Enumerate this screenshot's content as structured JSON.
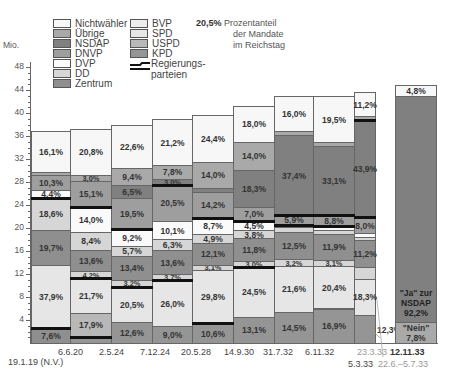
{
  "chart_data": {
    "type": "bar",
    "subtype": "stacked-variable-width (Mekko) bar chart",
    "title": "",
    "ylabel": "Mio.",
    "ylim": [
      0,
      48
    ],
    "yticks": [
      4,
      8,
      12,
      16,
      20,
      24,
      28,
      32,
      36,
      40,
      44,
      48
    ],
    "note": {
      "value": "20,5%",
      "text": "Prozentanteil der Mandate im Reichstag"
    },
    "legend": [
      {
        "name": "Nichtwähler",
        "color": "#f7f7f7"
      },
      {
        "name": "Übrige",
        "color": "#a9a9a9"
      },
      {
        "name": "NSDAP",
        "color": "#808080"
      },
      {
        "name": "DNVP",
        "color": "#9e9e9e"
      },
      {
        "name": "DVP",
        "color": "#fafafa"
      },
      {
        "name": "DD",
        "color": "#d6d6d6"
      },
      {
        "name": "Zentrum",
        "color": "#8f8f8f"
      },
      {
        "name": "BVP",
        "color": "#ececec"
      },
      {
        "name": "SPD",
        "color": "#e6e6e6"
      },
      {
        "name": "USPD",
        "color": "#b8b8b8"
      },
      {
        "name": "KPD",
        "color": "#959595"
      },
      {
        "name": "Regierungsparteien",
        "color": "#111111",
        "type": "line"
      }
    ],
    "categories": [
      "19.1.19 (N.V.)",
      "6.6.20",
      "2.5.24",
      "7.12.24",
      "20.5.28",
      "14.9.30",
      "31.7.32",
      "6.11.32",
      "5.3.33",
      "12.11.33"
    ],
    "extra_labels": [
      "23.3.33",
      "22.6.–5.7.33"
    ],
    "columns": [
      {
        "date": "19.1.19 (N.V.)",
        "segments": [
          {
            "party": "Zentrum",
            "label": "7,6%",
            "from": 0,
            "to": 2.6
          },
          {
            "party": "SPD",
            "label": "37,9%",
            "from": 2.6,
            "to": 13.6
          },
          {
            "party": "Zentrum",
            "label": "19,7%",
            "from": 13.6,
            "to": 19.7
          },
          {
            "party": "DD",
            "label": "18,6%",
            "from": 19.7,
            "to": 25.3
          },
          {
            "party": "DVP",
            "label": "4,4%",
            "from": 25.3,
            "to": 26.6
          },
          {
            "party": "DNVP",
            "label": "10,3%",
            "from": 26.6,
            "to": 29.2
          },
          {
            "party": "Übrige",
            "label": "",
            "from": 29.2,
            "to": 29.8
          },
          {
            "party": "Nichtwähler",
            "label": "16,1%",
            "from": 29.8,
            "to": 36.8
          }
        ]
      },
      {
        "date": "6.6.20",
        "segments": [
          {
            "party": "KPD",
            "label": "",
            "from": 0,
            "to": 1
          },
          {
            "party": "USPD",
            "label": "17,9%",
            "from": 1,
            "to": 5.3
          },
          {
            "party": "SPD",
            "label": "21,7%",
            "from": 5.3,
            "to": 11.3
          },
          {
            "party": "DD",
            "label": "4,2%",
            "from": 11.3,
            "to": 12.5
          },
          {
            "party": "Zentrum",
            "label": "13,6%",
            "from": 12.5,
            "to": 16.2
          },
          {
            "party": "DD",
            "label": "8,4%",
            "from": 16.2,
            "to": 19.3
          },
          {
            "party": "DVP",
            "label": "14,0%",
            "from": 19.3,
            "to": 23.7
          },
          {
            "party": "DNVP",
            "label": "15,1%",
            "from": 23.7,
            "to": 28.2
          },
          {
            "party": "Übrige",
            "label": "3,0%",
            "from": 28.2,
            "to": 29.3
          },
          {
            "party": "Nichtwähler",
            "label": "20,8%",
            "from": 29.3,
            "to": 37.2
          }
        ]
      },
      {
        "date": "2.5.24",
        "segments": [
          {
            "party": "KPD",
            "label": "12,6%",
            "from": 0,
            "to": 3.7
          },
          {
            "party": "SPD",
            "label": "20,5%",
            "from": 3.7,
            "to": 9.8
          },
          {
            "party": "DD",
            "label": "3,2%",
            "from": 9.8,
            "to": 10.9
          },
          {
            "party": "Zentrum",
            "label": "13,4%",
            "from": 10.9,
            "to": 15.2
          },
          {
            "party": "DD",
            "label": "5,7%",
            "from": 15.2,
            "to": 16.9
          },
          {
            "party": "DVP",
            "label": "9,2%",
            "from": 16.9,
            "to": 19.9
          },
          {
            "party": "DNVP",
            "label": "19,5%",
            "from": 19.9,
            "to": 25.3
          },
          {
            "party": "NSDAP",
            "label": "6,5%",
            "from": 25.3,
            "to": 27.5
          },
          {
            "party": "Übrige",
            "label": "9,4%",
            "from": 27.5,
            "to": 30.4
          },
          {
            "party": "Nichtwähler",
            "label": "22,6%",
            "from": 30.4,
            "to": 38.0
          }
        ]
      },
      {
        "date": "7.12.24",
        "segments": [
          {
            "party": "KPD",
            "label": "9,0%",
            "from": 0,
            "to": 2.9
          },
          {
            "party": "SPD",
            "label": "26,0%",
            "from": 2.9,
            "to": 11.0
          },
          {
            "party": "DD",
            "label": "3,7%",
            "from": 11.0,
            "to": 12.0
          },
          {
            "party": "Zentrum",
            "label": "13,6%",
            "from": 12.0,
            "to": 16.1
          },
          {
            "party": "DD",
            "label": "6,3%",
            "from": 16.1,
            "to": 18.1
          },
          {
            "party": "DVP",
            "label": "10,1%",
            "from": 18.1,
            "to": 21.2
          },
          {
            "party": "DNVP",
            "label": "20,5%",
            "from": 21.2,
            "to": 27.5
          },
          {
            "party": "NSDAP",
            "label": "3,0%",
            "from": 27.5,
            "to": 28.5
          },
          {
            "party": "Übrige",
            "label": "7,8%",
            "from": 28.5,
            "to": 31.0
          },
          {
            "party": "Nichtwähler",
            "label": "21,2%",
            "from": 31.0,
            "to": 38.9
          }
        ]
      },
      {
        "date": "20.5.28",
        "segments": [
          {
            "party": "KPD",
            "label": "10,6%",
            "from": 0,
            "to": 3.4
          },
          {
            "party": "SPD",
            "label": "29,8%",
            "from": 3.4,
            "to": 12.7
          },
          {
            "party": "DD",
            "label": "3,1%",
            "from": 12.7,
            "to": 13.6
          },
          {
            "party": "Zentrum",
            "label": "12,1%",
            "from": 13.6,
            "to": 17.4
          },
          {
            "party": "DD",
            "label": "4,9%",
            "from": 17.4,
            "to": 19.0
          },
          {
            "party": "DVP",
            "label": "8,7%",
            "from": 19.0,
            "to": 21.8
          },
          {
            "party": "DNVP",
            "label": "14,2%",
            "from": 21.8,
            "to": 26.3
          },
          {
            "party": "NSDAP",
            "label": "",
            "from": 26.3,
            "to": 27.0
          },
          {
            "party": "Übrige",
            "label": "14,0%",
            "from": 27.0,
            "to": 31.5
          },
          {
            "party": "Nichtwähler",
            "label": "24,4%",
            "from": 31.5,
            "to": 39.6
          }
        ]
      },
      {
        "date": "14.9.30",
        "segments": [
          {
            "party": "KPD",
            "label": "13,1%",
            "from": 0,
            "to": 4.6
          },
          {
            "party": "SPD",
            "label": "24,5%",
            "from": 4.6,
            "to": 13.2
          },
          {
            "party": "DD",
            "label": "3,0%",
            "from": 13.2,
            "to": 14.2
          },
          {
            "party": "Zentrum",
            "label": "11,8%",
            "from": 14.2,
            "to": 18.3
          },
          {
            "party": "DD",
            "label": "3,8%",
            "from": 18.3,
            "to": 19.6
          },
          {
            "party": "DVP",
            "label": "4,5%",
            "from": 19.6,
            "to": 21.2
          },
          {
            "party": "DNVP",
            "label": "7,0%",
            "from": 21.2,
            "to": 23.7
          },
          {
            "party": "NSDAP",
            "label": "18,3%",
            "from": 23.7,
            "to": 30.1
          },
          {
            "party": "Übrige",
            "label": "14,0%",
            "from": 30.1,
            "to": 35.0
          },
          {
            "party": "Nichtwähler",
            "label": "18,0%",
            "from": 35.0,
            "to": 41.3
          }
        ]
      },
      {
        "date": "31.7.32",
        "segments": [
          {
            "party": "KPD",
            "label": "14,5%",
            "from": 0,
            "to": 5.4
          },
          {
            "party": "SPD",
            "label": "21,6%",
            "from": 5.4,
            "to": 13.4
          },
          {
            "party": "DD",
            "label": "3,2%",
            "from": 13.4,
            "to": 14.6
          },
          {
            "party": "Zentrum",
            "label": "12,5%",
            "from": 14.6,
            "to": 19.3
          },
          {
            "party": "DD",
            "label": "",
            "from": 19.3,
            "to": 20.1
          },
          {
            "party": "DVP",
            "label": "",
            "from": 20.1,
            "to": 20.6
          },
          {
            "party": "DNVP",
            "label": "5,9%",
            "from": 20.6,
            "to": 22.2
          },
          {
            "party": "NSDAP",
            "label": "37,4%",
            "from": 22.2,
            "to": 36.2
          },
          {
            "party": "Übrige",
            "label": "",
            "from": 36.2,
            "to": 36.9
          },
          {
            "party": "Nichtwähler",
            "label": "16,0%",
            "from": 36.9,
            "to": 42.9
          }
        ]
      },
      {
        "date": "6.11.32",
        "segments": [
          {
            "party": "KPD",
            "label": "16,9%",
            "from": 0,
            "to": 6.0
          },
          {
            "party": "SPD",
            "label": "20,4%",
            "from": 6.0,
            "to": 13.4
          },
          {
            "party": "DD",
            "label": "3,1%",
            "from": 13.4,
            "to": 14.5
          },
          {
            "party": "Zentrum",
            "label": "11,9%",
            "from": 14.5,
            "to": 18.9
          },
          {
            "party": "DD",
            "label": "",
            "from": 18.9,
            "to": 19.6
          },
          {
            "party": "DVP",
            "label": "",
            "from": 19.6,
            "to": 20.3
          },
          {
            "party": "DNVP",
            "label": "8,8%",
            "from": 20.3,
            "to": 22.2
          },
          {
            "party": "NSDAP",
            "label": "33,1%",
            "from": 22.2,
            "to": 34.3
          },
          {
            "party": "Übrige",
            "label": "",
            "from": 34.3,
            "to": 35.0
          },
          {
            "party": "Nichtwähler",
            "label": "19,5%",
            "from": 35.0,
            "to": 42.9
          }
        ]
      },
      {
        "date": "5.3.33",
        "segments": [
          {
            "party": "KPD",
            "label": "12,3%",
            "from": 0,
            "to": 4.8
          },
          {
            "party": "SPD",
            "label": "18,3%",
            "from": 4.8,
            "to": 11.2
          },
          {
            "party": "DD",
            "label": "",
            "from": 11.2,
            "to": 13.2
          },
          {
            "party": "Zentrum",
            "label": "11,2%",
            "from": 13.2,
            "to": 17.9
          },
          {
            "party": "DD",
            "label": "",
            "from": 17.9,
            "to": 18.5
          },
          {
            "party": "DVP",
            "label": "",
            "from": 18.5,
            "to": 19.1
          },
          {
            "party": "DNVP",
            "label": "8,0%",
            "from": 19.1,
            "to": 21.9
          },
          {
            "party": "NSDAP",
            "label": "43,9%",
            "from": 21.9,
            "to": 38.8
          },
          {
            "party": "Übrige",
            "label": "",
            "from": 38.8,
            "to": 39.4
          },
          {
            "party": "Nichtwähler",
            "label": "11,2%",
            "from": 39.4,
            "to": 43.7
          }
        ]
      },
      {
        "date": "12.11.33",
        "segments": [
          {
            "party": "Übrige",
            "label": "\"Nein\" 7,8%",
            "from": 0,
            "to": 3.6
          },
          {
            "party": "NSDAP",
            "label": "\"Ja\" zur NSDAP 92,2%",
            "from": 3.6,
            "to": 43.0
          },
          {
            "party": "Nichtwähler",
            "label": "4,8%",
            "from": 43.0,
            "to": 44.9
          }
        ]
      }
    ]
  },
  "legend": {
    "col1": [
      "Nichtwähler",
      "Übrige",
      "NSDAP",
      "DNVP",
      "DVP",
      "DD",
      "Zentrum"
    ],
    "col2": [
      "BVP",
      "SPD",
      "USPD",
      "KPD"
    ],
    "gov_line_1": "Regierungs-",
    "gov_line_2": "parteien"
  },
  "note": {
    "value": "20,5%",
    "line1": "Prozentanteil",
    "line2": "der Mandate",
    "line3": "im Reichstag"
  },
  "axis": {
    "unit": "Mio.",
    "ticks": [
      "48",
      "44",
      "40",
      "36",
      "32",
      "28",
      "24",
      "20",
      "16",
      "12",
      "8",
      "4"
    ]
  },
  "xlabels": {
    "d1": "19.1.19 (N.V.)",
    "d2": "6.6.20",
    "d3": "2.5.24",
    "d4": "7.12.24",
    "d5": "20.5.28",
    "d6": "14.9.30",
    "d7": "31.7.32",
    "d8": "6.11.32",
    "d9": "5.3.33",
    "d10": "12.11.33",
    "e1": "23.3.33",
    "e2": "22.6.–5.7.33"
  },
  "labels": {
    "c1": [
      "7,6%",
      "37,9%",
      "19,7%",
      "18,6%",
      "4,4%",
      "10,3%",
      "16,1%"
    ],
    "c2": [
      "17,9%",
      "21,7%",
      "4,2%",
      "13,6%",
      "8,4%",
      "14,0%",
      "15,1%",
      "3,0%",
      "20,8%"
    ],
    "c3": [
      "12,6%",
      "20,5%",
      "3,2%",
      "13,4%",
      "5,7%",
      "9,2%",
      "19,5%",
      "6,5%",
      "9,4%",
      "22,6%"
    ],
    "c4": [
      "9,0%",
      "26,0%",
      "3,7%",
      "13,6%",
      "6,3%",
      "10,1%",
      "20,5%",
      "3,0%",
      "7,8%",
      "21,2%"
    ],
    "c5": [
      "10,6%",
      "29,8%",
      "3,1%",
      "12,1%",
      "4,9%",
      "8,7%",
      "14,2%",
      "14,0%",
      "24,4%"
    ],
    "c6": [
      "13,1%",
      "24,5%",
      "3,0%",
      "11,8%",
      "3,8%",
      "4,5%",
      "7,0%",
      "18,3%",
      "14,0%",
      "18,0%"
    ],
    "c7": [
      "14,5%",
      "21,6%",
      "3,2%",
      "12,5%",
      "5,9%",
      "37,4%",
      "16,0%"
    ],
    "c8": [
      "16,9%",
      "20,4%",
      "3,1%",
      "11,9%",
      "8,8%",
      "33,1%",
      "19,5%"
    ],
    "c9": [
      "12,3%",
      "18,3%",
      "11,2%",
      "8,0%",
      "43,9%",
      "11,2%"
    ],
    "c10": [
      "\"Nein\"",
      "7,8%",
      "\"Ja\" zur",
      "NSDAP",
      "92,2%",
      "4,8%"
    ]
  }
}
